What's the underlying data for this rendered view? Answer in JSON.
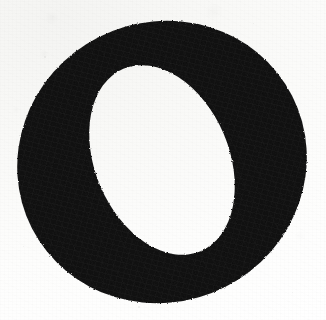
{
  "image": {
    "kind": "scanned-glyph",
    "width": 326,
    "height": 320,
    "caption": "O",
    "alt_text": "Scanned printed italic letter O"
  },
  "glyph": {
    "character": "O",
    "name": "letter-o",
    "style": "italic serif capital",
    "ink_color": "#101010",
    "paper_color": "#fbfbf9",
    "outer": {
      "center_x": 162,
      "center_y": 162,
      "radius_x": 146,
      "radius_y": 140,
      "rotation_deg": -27,
      "left": 18,
      "right": 307,
      "top": 22,
      "bottom": 302
    },
    "counter": {
      "center_x": 162,
      "center_y": 160,
      "radius_x": 67,
      "radius_y": 99,
      "rotation_deg": -23,
      "left": 96,
      "right": 228,
      "top": 63,
      "bottom": 258
    }
  },
  "specks": [
    {
      "x": 116,
      "y": 52,
      "d": 2,
      "o": 0.22
    },
    {
      "x": 44,
      "y": 56,
      "d": 2,
      "o": 0.18
    },
    {
      "x": 70,
      "y": 108,
      "d": 1,
      "o": 0.25
    },
    {
      "x": 253,
      "y": 23,
      "d": 1,
      "o": 0.2
    },
    {
      "x": 304,
      "y": 178,
      "d": 2,
      "o": 0.16
    },
    {
      "x": 138,
      "y": 306,
      "d": 2,
      "o": 0.22
    },
    {
      "x": 23,
      "y": 246,
      "d": 1,
      "o": 0.18
    },
    {
      "x": 292,
      "y": 292,
      "d": 1,
      "o": 0.15
    }
  ]
}
